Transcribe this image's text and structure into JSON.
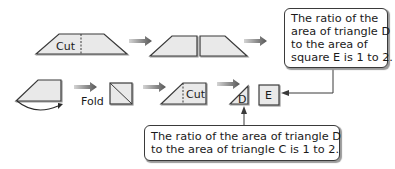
{
  "labels": {
    "cut_top": "Cut",
    "fold": "Fold",
    "cut_bottom": "Cut",
    "triangle_d": "D",
    "square_e": "E"
  },
  "callouts": {
    "top": {
      "lines": [
        "The ratio of the",
        "area of triangle D",
        "to the area of",
        "square E is 1 to 2."
      ]
    },
    "bottom": {
      "lines": [
        "The ratio of the area of triangle D",
        "to the area of triangle C is 1 to 2."
      ]
    }
  },
  "colors": {
    "shape_fill": "#e9e9e9",
    "stroke": "#3a3a3a",
    "arrow_gradient_start": "#d0d0d0",
    "arrow_gradient_end": "#5a5a5a"
  }
}
